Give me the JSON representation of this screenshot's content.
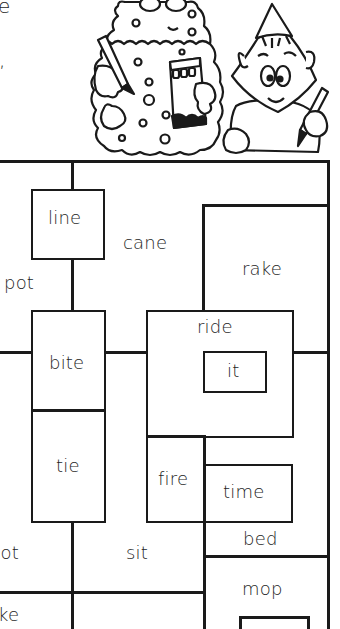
{
  "header_text": {
    "fragment_top": "e",
    "fragment_mid": ","
  },
  "illustration": {
    "characters": [
      "crayon-box-monster",
      "party-hat-boy"
    ],
    "icons": [
      "crayon-icon",
      "crayon-box-icon",
      "party-hat-icon"
    ]
  },
  "maze": {
    "words": [
      {
        "id": "line",
        "text": "line"
      },
      {
        "id": "cane",
        "text": "cane"
      },
      {
        "id": "rake",
        "text": "rake"
      },
      {
        "id": "pot",
        "text": "pot"
      },
      {
        "id": "ride",
        "text": "ride"
      },
      {
        "id": "it",
        "text": "it"
      },
      {
        "id": "bite",
        "text": "bite"
      },
      {
        "id": "tie",
        "text": "tie"
      },
      {
        "id": "fire",
        "text": "fire"
      },
      {
        "id": "time",
        "text": "time"
      },
      {
        "id": "bed",
        "text": "bed"
      },
      {
        "id": "hot",
        "text": "hot"
      },
      {
        "id": "sit",
        "text": "sit"
      },
      {
        "id": "mop",
        "text": "mop"
      },
      {
        "id": "ke",
        "text": "ke"
      }
    ]
  },
  "colors": {
    "ink": "#1a1a1a",
    "paper": "#ffffff"
  }
}
